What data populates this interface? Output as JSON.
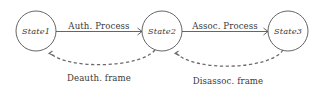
{
  "diagram": {
    "background_color": "#ffffff",
    "stroke_color": "#555555",
    "dash_color": "#6b6b6b",
    "text_color": "#3a3a3a",
    "nodes": [
      {
        "id": "state1",
        "label": "State1",
        "cx": 36,
        "cy": 31,
        "r": 20
      },
      {
        "id": "state2",
        "label": "State2",
        "cx": 162,
        "cy": 31,
        "r": 20
      },
      {
        "id": "state3",
        "label": "State3",
        "cx": 288,
        "cy": 31,
        "r": 20
      }
    ],
    "solid_edges": [
      {
        "id": "auth-process",
        "label": "Auth. Process",
        "from": "state1",
        "to": "state2",
        "label_x": 99,
        "label_y": 28
      },
      {
        "id": "assoc-process",
        "label": "Assoc. Process",
        "from": "state2",
        "to": "state3",
        "label_x": 225,
        "label_y": 28
      }
    ],
    "dashed_edges": [
      {
        "id": "deauth-frame",
        "label": "Deauth. frame",
        "from": "state2",
        "to": "state1",
        "label_x": 99,
        "label_y": 78
      },
      {
        "id": "disassoc-frame",
        "label": "Disassoc. frame",
        "from": "state3",
        "to": "state2",
        "label_x": 228,
        "label_y": 81
      }
    ]
  }
}
